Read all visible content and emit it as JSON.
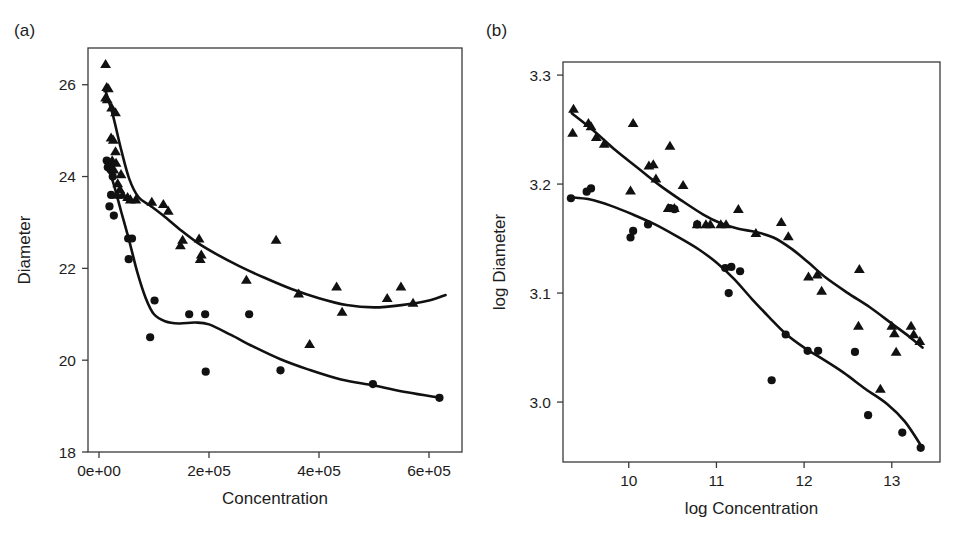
{
  "figure": {
    "background": "#ffffff",
    "ink_color": "#111111",
    "panels": [
      "a",
      "b"
    ]
  },
  "panel_a": {
    "label": "(a)",
    "xlabel": "Concentration",
    "ylabel": "Diameter"
  },
  "panel_b": {
    "label": "(b)",
    "xlabel": "log Concentration",
    "ylabel": "log Diameter"
  },
  "chart_data": [
    {
      "panel": "a",
      "type": "scatter",
      "title": "(a)",
      "xlabel": "Concentration",
      "ylabel": "Diameter",
      "xlim": [
        -20000,
        660000
      ],
      "ylim": [
        18,
        26.8
      ],
      "xticks": [
        0,
        200000,
        400000,
        600000
      ],
      "xtick_labels": [
        "0e+00",
        "2e+05",
        "4e+05",
        "6e+05"
      ],
      "yticks": [
        18,
        20,
        22,
        24,
        26
      ],
      "ytick_labels": [
        "18",
        "20",
        "22",
        "24",
        "26"
      ],
      "grid": false,
      "legend": "none",
      "series": [
        {
          "name": "triangles",
          "marker": "triangle",
          "points": [
            [
              12000,
              26.45
            ],
            [
              14000,
              25.95
            ],
            [
              17000,
              25.92
            ],
            [
              12000,
              25.72
            ],
            [
              15000,
              25.68
            ],
            [
              23000,
              25.5
            ],
            [
              30000,
              25.4
            ],
            [
              22000,
              24.85
            ],
            [
              26000,
              24.8
            ],
            [
              30000,
              24.55
            ],
            [
              24000,
              24.35
            ],
            [
              31000,
              24.3
            ],
            [
              27000,
              24.15
            ],
            [
              40000,
              24.05
            ],
            [
              34000,
              23.85
            ],
            [
              38000,
              23.72
            ],
            [
              33000,
              23.6
            ],
            [
              43000,
              23.6
            ],
            [
              52000,
              23.55
            ],
            [
              57000,
              23.5
            ],
            [
              67000,
              23.5
            ],
            [
              96000,
              23.45
            ],
            [
              117000,
              23.4
            ],
            [
              126000,
              23.25
            ],
            [
              152000,
              22.62
            ],
            [
              148000,
              22.5
            ],
            [
              182000,
              22.65
            ],
            [
              186000,
              22.3
            ],
            [
              184000,
              22.2
            ],
            [
              268000,
              21.75
            ],
            [
              322000,
              22.62
            ],
            [
              363000,
              21.45
            ],
            [
              383000,
              20.35
            ],
            [
              432000,
              21.6
            ],
            [
              442000,
              21.05
            ],
            [
              524000,
              21.35
            ],
            [
              549000,
              21.6
            ],
            [
              571000,
              21.25
            ]
          ]
        },
        {
          "name": "circles",
          "marker": "circle",
          "points": [
            [
              14000,
              24.35
            ],
            [
              18000,
              24.3
            ],
            [
              16000,
              24.2
            ],
            [
              21000,
              24.15
            ],
            [
              25000,
              24.0
            ],
            [
              22000,
              23.6
            ],
            [
              19000,
              23.35
            ],
            [
              27000,
              23.15
            ],
            [
              53000,
              22.65
            ],
            [
              60000,
              22.65
            ],
            [
              54000,
              22.2
            ],
            [
              101000,
              21.3
            ],
            [
              93000,
              20.5
            ],
            [
              164000,
              21.0
            ],
            [
              193000,
              21.0
            ],
            [
              273000,
              21.0
            ],
            [
              194000,
              19.75
            ],
            [
              330000,
              19.78
            ],
            [
              498000,
              19.48
            ],
            [
              619000,
              19.18
            ]
          ]
        }
      ],
      "fit_curves": [
        {
          "name": "triangle-loess",
          "points": [
            [
              11000,
              25.9
            ],
            [
              25000,
              25.35
            ],
            [
              40000,
              24.6
            ],
            [
              55000,
              23.95
            ],
            [
              72000,
              23.55
            ],
            [
              95000,
              23.35
            ],
            [
              120000,
              23.12
            ],
            [
              150000,
              22.82
            ],
            [
              180000,
              22.55
            ],
            [
              215000,
              22.3
            ],
            [
              255000,
              22.05
            ],
            [
              300000,
              21.8
            ],
            [
              350000,
              21.55
            ],
            [
              400000,
              21.35
            ],
            [
              450000,
              21.2
            ],
            [
              500000,
              21.15
            ],
            [
              550000,
              21.2
            ],
            [
              600000,
              21.3
            ],
            [
              630000,
              21.42
            ]
          ]
        },
        {
          "name": "circle-loess",
          "points": [
            [
              12000,
              24.3
            ],
            [
              25000,
              23.9
            ],
            [
              40000,
              23.25
            ],
            [
              55000,
              22.6
            ],
            [
              70000,
              21.9
            ],
            [
              85000,
              21.35
            ],
            [
              100000,
              21.0
            ],
            [
              120000,
              20.85
            ],
            [
              145000,
              20.8
            ],
            [
              175000,
              20.82
            ],
            [
              200000,
              20.78
            ],
            [
              240000,
              20.55
            ],
            [
              280000,
              20.3
            ],
            [
              330000,
              20.02
            ],
            [
              380000,
              19.8
            ],
            [
              440000,
              19.58
            ],
            [
              500000,
              19.45
            ],
            [
              560000,
              19.3
            ],
            [
              620000,
              19.18
            ]
          ]
        }
      ]
    },
    {
      "panel": "b",
      "type": "scatter",
      "title": "(b)",
      "xlabel": "log Concentration",
      "ylabel": "log Diameter",
      "xlim": [
        9.25,
        13.55
      ],
      "ylim": [
        2.945,
        3.312
      ],
      "xticks": [
        10,
        11,
        12,
        13
      ],
      "xtick_labels": [
        "10",
        "11",
        "12",
        "13"
      ],
      "yticks": [
        3.0,
        3.1,
        3.2,
        3.3
      ],
      "ytick_labels": [
        "3.0",
        "3.1",
        "3.2",
        "3.3"
      ],
      "grid": false,
      "legend": "none",
      "series": [
        {
          "name": "triangles",
          "marker": "triangle",
          "points": [
            [
              9.37,
              3.269
            ],
            [
              9.36,
              3.247
            ],
            [
              9.54,
              3.256
            ],
            [
              9.57,
              3.253
            ],
            [
              9.63,
              3.243
            ],
            [
              9.72,
              3.237
            ],
            [
              10.05,
              3.256
            ],
            [
              10.02,
              3.194
            ],
            [
              10.23,
              3.217
            ],
            [
              10.28,
              3.218
            ],
            [
              10.31,
              3.205
            ],
            [
              10.47,
              3.235
            ],
            [
              10.45,
              3.178
            ],
            [
              10.52,
              3.178
            ],
            [
              10.62,
              3.199
            ],
            [
              10.78,
              3.163
            ],
            [
              10.88,
              3.163
            ],
            [
              10.93,
              3.163
            ],
            [
              11.05,
              3.163
            ],
            [
              11.11,
              3.163
            ],
            [
              11.25,
              3.177
            ],
            [
              11.45,
              3.155
            ],
            [
              11.74,
              3.165
            ],
            [
              11.82,
              3.152
            ],
            [
              12.05,
              3.115
            ],
            [
              12.15,
              3.117
            ],
            [
              12.2,
              3.102
            ],
            [
              12.63,
              3.122
            ],
            [
              12.62,
              3.07
            ],
            [
              12.87,
              3.012
            ],
            [
              13.0,
              3.07
            ],
            [
              13.03,
              3.063
            ],
            [
              13.05,
              3.046
            ],
            [
              13.22,
              3.07
            ],
            [
              13.25,
              3.062
            ],
            [
              13.32,
              3.056
            ]
          ]
        },
        {
          "name": "circles",
          "marker": "circle",
          "points": [
            [
              9.34,
              3.187
            ],
            [
              9.52,
              3.193
            ],
            [
              9.57,
              3.196
            ],
            [
              10.02,
              3.151
            ],
            [
              10.05,
              3.157
            ],
            [
              10.22,
              3.163
            ],
            [
              10.47,
              3.178
            ],
            [
              10.52,
              3.177
            ],
            [
              10.78,
              3.163
            ],
            [
              11.1,
              3.123
            ],
            [
              11.14,
              3.1
            ],
            [
              11.17,
              3.124
            ],
            [
              11.27,
              3.12
            ],
            [
              11.63,
              3.02
            ],
            [
              11.79,
              3.062
            ],
            [
              12.04,
              3.047
            ],
            [
              12.16,
              3.047
            ],
            [
              12.58,
              3.046
            ],
            [
              12.73,
              2.988
            ],
            [
              13.12,
              2.972
            ],
            [
              13.33,
              2.958
            ]
          ]
        }
      ],
      "fit_curves": [
        {
          "name": "triangle-loess",
          "points": [
            [
              9.35,
              3.265
            ],
            [
              9.6,
              3.249
            ],
            [
              9.85,
              3.231
            ],
            [
              10.1,
              3.215
            ],
            [
              10.35,
              3.199
            ],
            [
              10.6,
              3.185
            ],
            [
              10.85,
              3.172
            ],
            [
              11.05,
              3.164
            ],
            [
              11.25,
              3.159
            ],
            [
              11.45,
              3.156
            ],
            [
              11.65,
              3.151
            ],
            [
              11.85,
              3.141
            ],
            [
              12.05,
              3.128
            ],
            [
              12.25,
              3.114
            ],
            [
              12.5,
              3.1
            ],
            [
              12.75,
              3.087
            ],
            [
              13.0,
              3.072
            ],
            [
              13.2,
              3.06
            ],
            [
              13.35,
              3.05
            ]
          ]
        },
        {
          "name": "circle-loess",
          "points": [
            [
              9.33,
              3.188
            ],
            [
              9.55,
              3.186
            ],
            [
              9.8,
              3.18
            ],
            [
              10.05,
              3.172
            ],
            [
              10.3,
              3.163
            ],
            [
              10.55,
              3.152
            ],
            [
              10.8,
              3.14
            ],
            [
              11.0,
              3.128
            ],
            [
              11.2,
              3.113
            ],
            [
              11.4,
              3.095
            ],
            [
              11.6,
              3.078
            ],
            [
              11.8,
              3.062
            ],
            [
              12.0,
              3.05
            ],
            [
              12.2,
              3.04
            ],
            [
              12.45,
              3.027
            ],
            [
              12.7,
              3.012
            ],
            [
              12.95,
              2.998
            ],
            [
              13.15,
              2.982
            ],
            [
              13.35,
              2.958
            ]
          ]
        }
      ]
    }
  ]
}
